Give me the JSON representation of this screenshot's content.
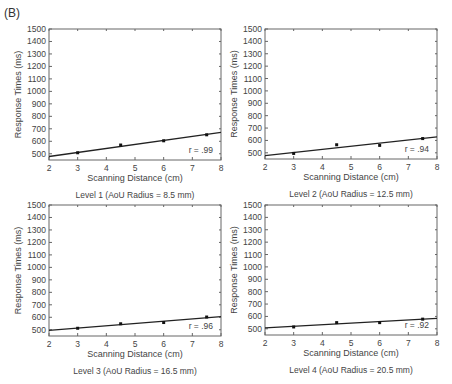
{
  "figure": {
    "panel_label": "(B)"
  },
  "chart_data": [
    {
      "type": "scatter",
      "title": "Level 1 (AoU Radius = 8.5 mm)",
      "xlabel": "Scanning Distance (cm)",
      "ylabel": "Response Times (ms)",
      "xlim": [
        2,
        8
      ],
      "ylim": [
        450,
        1500
      ],
      "xticks": [
        2,
        3,
        4,
        5,
        6,
        7,
        8
      ],
      "yticks": [
        500,
        600,
        700,
        800,
        900,
        1000,
        1100,
        1200,
        1300,
        1400,
        1500
      ],
      "grid": false,
      "x": [
        3,
        4.5,
        6,
        7.5
      ],
      "y": [
        508,
        570,
        604,
        652
      ],
      "fit_line": {
        "x": [
          2,
          8
        ],
        "y": [
          478,
          672
        ]
      },
      "annotation": "r = .99"
    },
    {
      "type": "scatter",
      "title": "Level 2 (AoU Radius = 12.5 mm)",
      "xlabel": "Scanning Distance (cm)",
      "ylabel": "Response Times (ms)",
      "xlim": [
        2,
        8
      ],
      "ylim": [
        450,
        1500
      ],
      "xticks": [
        2,
        3,
        4,
        5,
        6,
        7,
        8
      ],
      "yticks": [
        500,
        600,
        700,
        800,
        900,
        1000,
        1100,
        1200,
        1300,
        1400,
        1500
      ],
      "grid": false,
      "x": [
        3,
        4.5,
        6,
        7.5
      ],
      "y": [
        495,
        565,
        560,
        615
      ],
      "fit_line": {
        "x": [
          2,
          8
        ],
        "y": [
          478,
          628
        ]
      },
      "annotation": "r = .94"
    },
    {
      "type": "scatter",
      "title": "Level 3 (AoU Radius = 16.5 mm)",
      "xlabel": "Scanning Distance (cm)",
      "ylabel": "Response Times (ms)",
      "xlim": [
        2,
        8
      ],
      "ylim": [
        450,
        1500
      ],
      "xticks": [
        2,
        3,
        4,
        5,
        6,
        7,
        8
      ],
      "yticks": [
        500,
        600,
        700,
        800,
        900,
        1000,
        1100,
        1200,
        1300,
        1400,
        1500
      ],
      "grid": false,
      "x": [
        3,
        4.5,
        6,
        7.5
      ],
      "y": [
        512,
        548,
        558,
        602
      ],
      "fit_line": {
        "x": [
          2,
          8
        ],
        "y": [
          495,
          605
        ]
      },
      "annotation": "r = .96"
    },
    {
      "type": "scatter",
      "title": "Level 4 (AoU Radius = 20.5 mm)",
      "xlabel": "Scanning Distance (cm)",
      "ylabel": "Response Times (ms)",
      "xlim": [
        2,
        8
      ],
      "ylim": [
        450,
        1500
      ],
      "xticks": [
        2,
        3,
        4,
        5,
        6,
        7,
        8
      ],
      "yticks": [
        500,
        600,
        700,
        800,
        900,
        1000,
        1100,
        1200,
        1300,
        1400,
        1500
      ],
      "grid": false,
      "x": [
        3,
        4.5,
        6,
        7.5
      ],
      "y": [
        515,
        550,
        550,
        578
      ],
      "fit_line": {
        "x": [
          2,
          8
        ],
        "y": [
          508,
          585
        ]
      },
      "annotation": "r = .92"
    }
  ],
  "layout": {
    "frames": [
      {
        "left": 49,
        "top": 29,
        "right": 221,
        "bottom": 160
      },
      {
        "left": 265,
        "top": 29,
        "right": 437,
        "bottom": 159
      },
      {
        "left": 49,
        "top": 205,
        "right": 221,
        "bottom": 336
      },
      {
        "left": 265,
        "top": 205,
        "right": 437,
        "bottom": 335
      }
    ],
    "colors": {
      "frame": "#666666",
      "line": "#222222",
      "marker": "#111111",
      "text": "#444444"
    }
  }
}
